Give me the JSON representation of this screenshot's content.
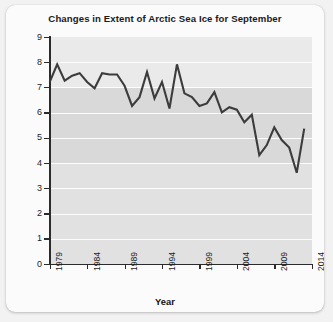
{
  "chart_data": {
    "type": "line",
    "title": "Changes in Extent of Arctic Sea Ice for September",
    "xlabel": "Year",
    "ylabel": "Million km²",
    "xlim": [
      1979,
      2014
    ],
    "ylim": [
      0,
      9
    ],
    "grid": true,
    "legend": "none",
    "line_color": "#3c3c3c",
    "plot_background": "#e3e3e3",
    "gridline_color": "#fdfdfd",
    "y_ticks": [
      0,
      1,
      2,
      3,
      4,
      5,
      6,
      7,
      8,
      9
    ],
    "y_tick_labels": [
      "0",
      "1",
      "2",
      "3",
      "4",
      "5",
      "6",
      "7",
      "8",
      "9"
    ],
    "x_ticks": [
      1979,
      1984,
      1989,
      1994,
      1999,
      2004,
      2009,
      2014
    ],
    "x_tick_labels": [
      "1979",
      "1984",
      "1989",
      "1994",
      "1999",
      "2004",
      "2009",
      "2014"
    ],
    "x": [
      1979,
      1980,
      1981,
      1982,
      1983,
      1984,
      1985,
      1986,
      1987,
      1988,
      1989,
      1990,
      1991,
      1992,
      1993,
      1994,
      1995,
      1996,
      1997,
      1998,
      1999,
      2000,
      2001,
      2002,
      2003,
      2004,
      2005,
      2006,
      2007,
      2008,
      2009,
      2010,
      2011,
      2012,
      2013
    ],
    "values": [
      7.2,
      7.9,
      7.25,
      7.45,
      7.55,
      7.2,
      6.95,
      7.55,
      7.5,
      7.5,
      7.05,
      6.25,
      6.6,
      7.6,
      6.55,
      7.2,
      6.15,
      7.9,
      6.75,
      6.6,
      6.25,
      6.35,
      6.8,
      6.0,
      6.2,
      6.1,
      5.6,
      5.9,
      4.3,
      4.7,
      5.4,
      4.9,
      4.6,
      3.6,
      5.35
    ],
    "units": "Million km²",
    "annotations": []
  }
}
